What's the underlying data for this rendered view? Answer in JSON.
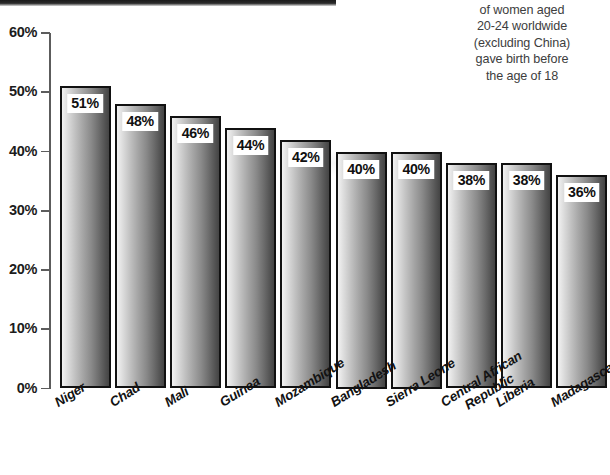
{
  "caption": {
    "lines": [
      "of women aged",
      "20-24 worldwide",
      "(excluding China)",
      "gave birth before",
      "the age of 18"
    ]
  },
  "colors": {
    "axis": "#5c5c5c",
    "bar_border": "#111111",
    "bar_light": "#f2f2f2",
    "bar_dark": "#444444",
    "text": "#1c1c1c",
    "caption_text": "#3d3d3d",
    "rule": "#1a1a1a"
  },
  "chart_data": {
    "type": "bar",
    "title": "",
    "subtitle": "of women aged 20-24 worldwide (excluding China) gave birth before the age of 18",
    "xlabel": "",
    "ylabel": "",
    "ylim": [
      0,
      60
    ],
    "ytick_labels": [
      "60%",
      "50%",
      "40%",
      "30%",
      "20%",
      "10%",
      "0%"
    ],
    "yticks": [
      60,
      50,
      40,
      30,
      20,
      10,
      0
    ],
    "grid": false,
    "legend": "none",
    "categories": [
      "Niger",
      "Chad",
      "Mali",
      "Guinea",
      "Mozambique",
      "Bangladesh",
      "Sierra Leone",
      "Central African Republic",
      "Liberia",
      "Madagascar"
    ],
    "values": [
      51,
      48,
      46,
      44,
      42,
      40,
      40,
      38,
      38,
      36
    ],
    "value_labels": [
      "51%",
      "48%",
      "46%",
      "44%",
      "42%",
      "40%",
      "40%",
      "38%",
      "38%",
      "36%"
    ]
  }
}
